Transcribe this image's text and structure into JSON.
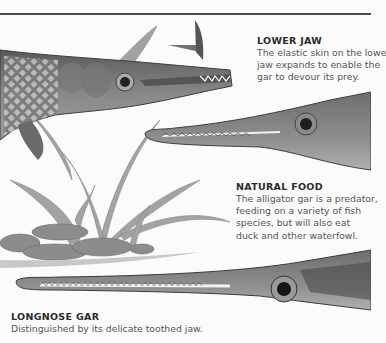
{
  "captions": {
    "lower_jaw": {
      "title": "LOWER JAW",
      "lines": [
        "The elastic skin on the lowe",
        "jaw expands to enable the",
        "gar to devour its prey."
      ]
    },
    "natural_food": {
      "title": "NATURAL FOOD",
      "lines": [
        "The alligator gar is a predator,",
        "feeding on a variety of fish",
        "species, but will also eat",
        "duck and other waterfowl."
      ]
    },
    "longnose_gar": {
      "title": "LONGNOSE GAR",
      "lines": [
        "Distinguished by its delicate toothed jaw."
      ]
    }
  },
  "illustrations": [
    "alligator-gar-head-jaw-open",
    "alligator-gar-snout",
    "aquatic-plants-and-rocks",
    "longnose-gar-head",
    "small-fish"
  ],
  "colors": {
    "background": "#fbfbfb",
    "rule": "#4a4a4a",
    "ink": "#3a3a3a"
  }
}
